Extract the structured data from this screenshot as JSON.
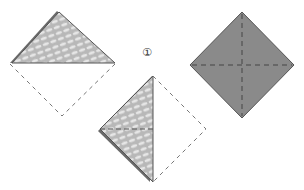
{
  "diagram": {
    "type": "origami-folding-instructions",
    "step_marker": "①",
    "colors": {
      "paper_dark": "#8a8a8a",
      "paper_pattern_light": "#e4e4e4",
      "paper_pattern_mid": "#b5b5b5",
      "edge": "#555555",
      "dashed_line": "#666666",
      "background": "#ffffff"
    },
    "figures": [
      {
        "name": "folded-triangle-top",
        "description": "Triangle folded upward with dashed outline of original lower half"
      },
      {
        "name": "folded-triangle-side",
        "description": "Triangle folded left with dashed outline of right half and horizontal dashed crease"
      },
      {
        "name": "square-diamond",
        "description": "Grey square rotated 45° with dashed crease lines"
      }
    ]
  }
}
